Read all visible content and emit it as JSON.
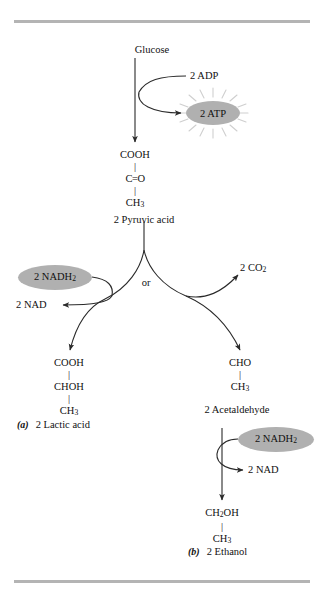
{
  "figure": {
    "title_top_rule": "horizontal-rule",
    "title_bottom_rule": "horizontal-rule"
  },
  "glycolysis": {
    "substrate_label": "Glucose",
    "adp_label": "2 ADP",
    "atp_label": "2 ATP",
    "pyruvate_formula": {
      "line1": "COOH",
      "bond1": "|",
      "line2": "C=O",
      "bond2": "|",
      "line3": "CH",
      "line3_sub": "3"
    },
    "pyruvate_label": "2 Pyruvic acid",
    "branch_label": "or"
  },
  "lactic_branch": {
    "nadh_label": "2 NADH",
    "nadh_sub": "2",
    "nad_label": "2 NAD",
    "product_formula": {
      "line1": "COOH",
      "bond1": "|",
      "line2": "CHOH",
      "bond2": "|",
      "line3": "CH",
      "line3_sub": "3"
    },
    "caption_tag": "(a)",
    "caption_text": "2 Lactic acid"
  },
  "ethanol_branch": {
    "co2_label": "2 CO",
    "co2_sub": "2",
    "acetaldehyde_formula": {
      "line1": "CHO",
      "bond1": "|",
      "line2": "CH",
      "line2_sub": "3"
    },
    "acetaldehyde_label": "2 Acetaldehyde",
    "nadh_label": "2 NADH",
    "nadh_sub": "2",
    "nad_label": "2 NAD",
    "product_formula": {
      "line1": "CH",
      "line1_sub": "2",
      "line1_tail": "OH",
      "bond1": "|",
      "line2": "CH",
      "line2_sub": "3"
    },
    "caption_tag": "(b)",
    "caption_text": "2 Ethanol"
  },
  "colors": {
    "rule": "#b4b4b4",
    "badge_fill": "#b0b0b0",
    "arrow": "#2a2a2a",
    "starburst": "#cfcfcf"
  }
}
